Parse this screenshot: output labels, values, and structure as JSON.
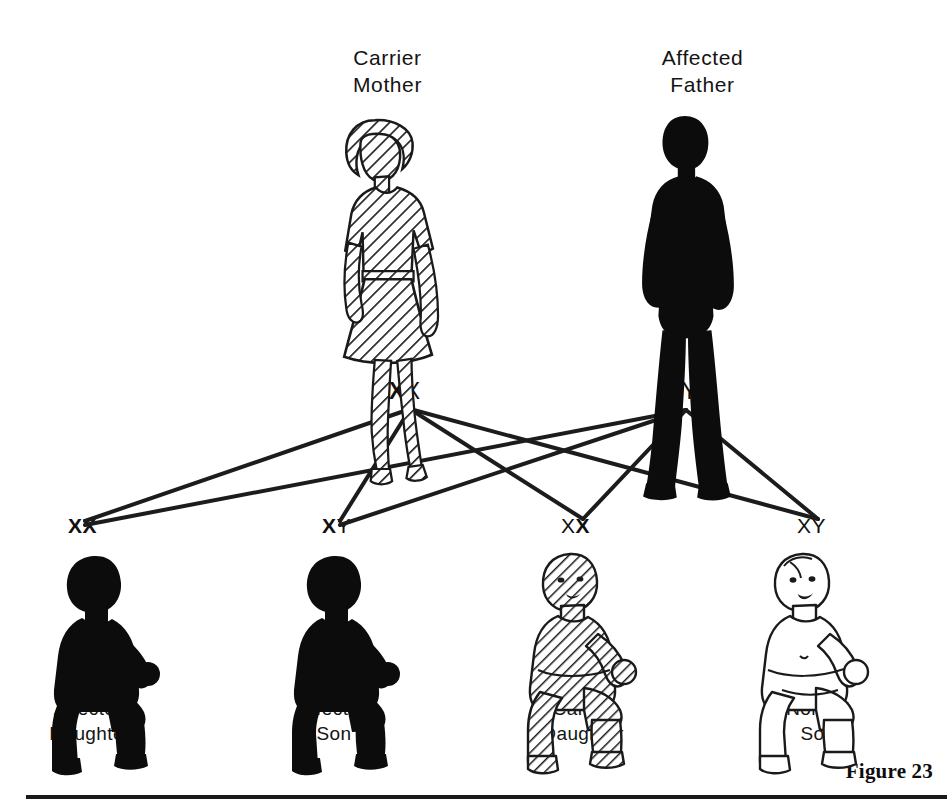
{
  "figure": {
    "number_label": "Figure 23",
    "background_color": "#ffffff",
    "ink_color": "#111111"
  },
  "parents": [
    {
      "id": "mother",
      "caption": "Carrier\nMother",
      "role": "Carrier Mother",
      "sex": "female",
      "status": "carrier",
      "fill_style": "hatched",
      "genotype": "XX",
      "alleles": [
        {
          "letter": "X",
          "bold": true
        },
        {
          "letter": "X",
          "bold": false
        }
      ]
    },
    {
      "id": "father",
      "caption": "Affected\nFather",
      "role": "Affected Father",
      "sex": "male",
      "status": "affected",
      "fill_style": "solid",
      "genotype": "XY",
      "alleles": [
        {
          "letter": "X",
          "bold": true
        },
        {
          "letter": "Y",
          "bold": false
        }
      ]
    }
  ],
  "children": [
    {
      "id": "child-0",
      "caption": "Affected\nDaughter",
      "role": "Affected Daughter",
      "sex": "female",
      "status": "affected",
      "fill_style": "solid",
      "genotype": "XX",
      "alleles": [
        {
          "letter": "X",
          "bold": true
        },
        {
          "letter": "X",
          "bold": true
        }
      ]
    },
    {
      "id": "child-1",
      "caption": "Affected\nSon",
      "role": "Affected Son",
      "sex": "male",
      "status": "affected",
      "fill_style": "solid",
      "genotype": "XY",
      "alleles": [
        {
          "letter": "X",
          "bold": true
        },
        {
          "letter": "Y",
          "bold": false
        }
      ]
    },
    {
      "id": "child-2",
      "caption": "Carrier\nDaughter",
      "role": "Carrier Daughter",
      "sex": "female",
      "status": "carrier",
      "fill_style": "hatched",
      "genotype": "XX",
      "alleles": [
        {
          "letter": "X",
          "bold": false
        },
        {
          "letter": "X",
          "bold": true
        }
      ]
    },
    {
      "id": "child-3",
      "caption": "Normal\nSon",
      "role": "Normal Son",
      "sex": "male",
      "status": "normal",
      "fill_style": "outline",
      "genotype": "XY",
      "alleles": [
        {
          "letter": "X",
          "bold": false
        },
        {
          "letter": "Y",
          "bold": false
        }
      ]
    }
  ],
  "inheritance_lines": {
    "description": "Each parent node connects to all four children",
    "parent_nodes": [
      {
        "id": "mother-node",
        "x": 410,
        "y": 409
      },
      {
        "id": "father-node",
        "x": 686,
        "y": 410
      }
    ],
    "child_nodes": [
      {
        "id": "child-node-0",
        "x": 85,
        "y": 521
      },
      {
        "id": "child-node-1",
        "x": 340,
        "y": 521
      },
      {
        "id": "child-node-2",
        "x": 583,
        "y": 519
      },
      {
        "id": "child-node-3",
        "x": 818,
        "y": 519
      }
    ],
    "stroke_color": "#1c1c1c",
    "stroke_width": 4
  }
}
